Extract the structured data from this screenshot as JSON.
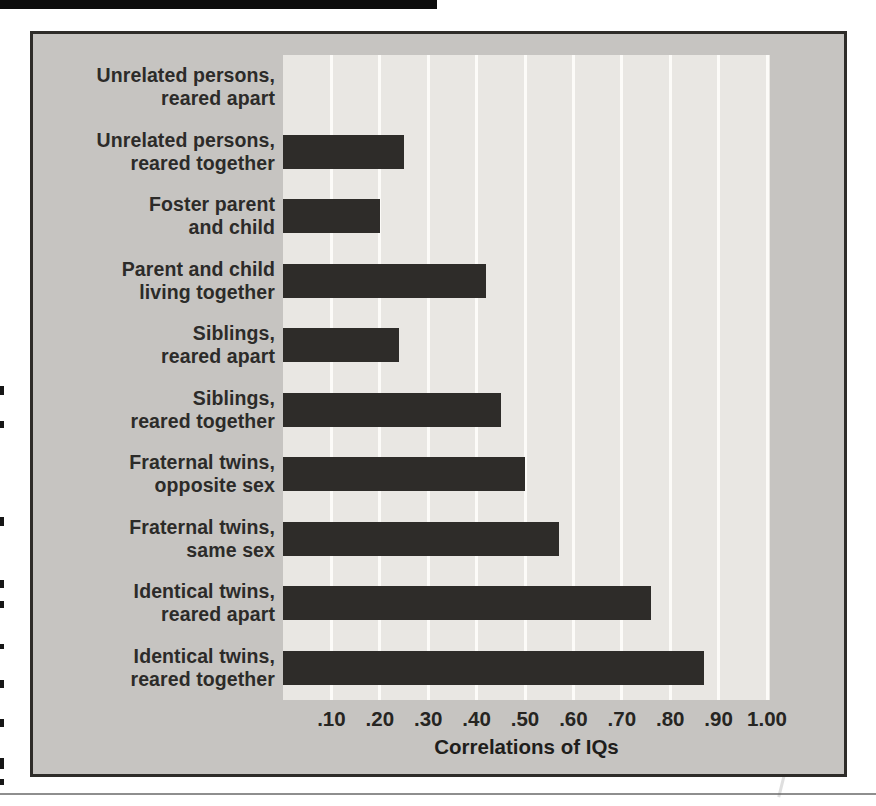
{
  "figure": {
    "x_axis_title": "Correlations of IQs"
  },
  "chart_data": {
    "type": "bar",
    "orientation": "horizontal",
    "title": "",
    "xlabel": "Correlations of IQs",
    "ylabel": "",
    "xlim": [
      0,
      1.0
    ],
    "grid": "vertical-white-lines",
    "legend": "none",
    "categories": [
      {
        "line1": "Unrelated persons,",
        "line2": "reared apart"
      },
      {
        "line1": "Unrelated persons,",
        "line2": "reared together"
      },
      {
        "line1": "Foster parent",
        "line2": "and child"
      },
      {
        "line1": "Parent and child",
        "line2": "living together"
      },
      {
        "line1": "Siblings,",
        "line2": "reared apart"
      },
      {
        "line1": "Siblings,",
        "line2": "reared together"
      },
      {
        "line1": "Fraternal twins,",
        "line2": "opposite sex"
      },
      {
        "line1": "Fraternal twins,",
        "line2": "same sex"
      },
      {
        "line1": "Identical twins,",
        "line2": "reared apart"
      },
      {
        "line1": "Identical twins,",
        "line2": "reared together"
      }
    ],
    "values": [
      0.0,
      0.25,
      0.2,
      0.42,
      0.24,
      0.45,
      0.5,
      0.57,
      0.76,
      0.87
    ],
    "xticks": [
      {
        "label": ".10",
        "value": 0.1
      },
      {
        "label": ".20",
        "value": 0.2
      },
      {
        "label": ".30",
        "value": 0.3
      },
      {
        "label": ".40",
        "value": 0.4
      },
      {
        "label": ".50",
        "value": 0.5
      },
      {
        "label": ".60",
        "value": 0.6
      },
      {
        "label": ".70",
        "value": 0.7
      },
      {
        "label": ".80",
        "value": 0.8
      },
      {
        "label": ".90",
        "value": 0.9
      },
      {
        "label": "1.00",
        "value": 1.0
      }
    ],
    "colors": {
      "bar": "#2e2c29",
      "plot_background": "#e9e7e3",
      "panel_background": "#c6c4c1",
      "panel_border": "#2e2c29",
      "gridline": "#fcfbf8",
      "text": "#2c2b29"
    }
  }
}
